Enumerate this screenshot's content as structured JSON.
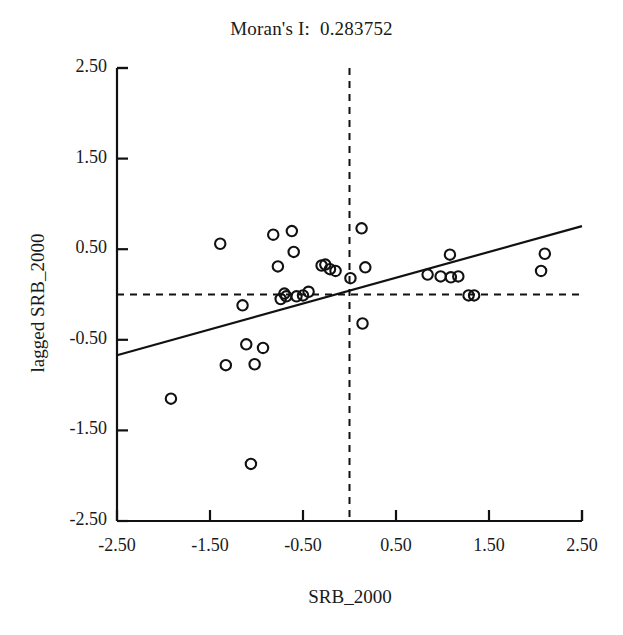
{
  "chart_data": {
    "type": "scatter",
    "title": "Moran's I:  0.283752",
    "moran_i": 0.283752,
    "xlabel": "SRB_2000",
    "ylabel": "lagged SRB_2000",
    "xlim": [
      -2.5,
      2.5
    ],
    "ylim": [
      -2.5,
      2.5
    ],
    "xticks": [
      "-2.50",
      "-1.50",
      "-0.50",
      "0.50",
      "1.50",
      "2.50"
    ],
    "xtick_values": [
      -2.5,
      -1.5,
      -0.5,
      0.5,
      1.5,
      2.5
    ],
    "yticks": [
      "2.50",
      "1.50",
      "0.50",
      "-0.50",
      "-1.50",
      "-2.50"
    ],
    "ytick_values": [
      2.5,
      1.5,
      0.5,
      -0.5,
      -1.5,
      -2.5
    ],
    "grid": false,
    "legend": null,
    "marker": "open-circle",
    "marker_color": "#111111",
    "marker_fill": "none",
    "line_color": "#111111",
    "reference_lines": {
      "vertical_x": 0,
      "horizontal_y": 0,
      "style": "dashed"
    },
    "regression_line": {
      "slope": 0.285,
      "intercept": 0.0425,
      "x_start": -2.5,
      "y_start": -0.67,
      "x_end": 2.5,
      "y_end": 0.755,
      "style": "solid"
    },
    "points": [
      {
        "x": -1.92,
        "y": -1.15
      },
      {
        "x": -1.39,
        "y": 0.56
      },
      {
        "x": -1.33,
        "y": -0.78
      },
      {
        "x": -1.15,
        "y": -0.12
      },
      {
        "x": -1.11,
        "y": -0.55
      },
      {
        "x": -1.06,
        "y": -1.87
      },
      {
        "x": -1.02,
        "y": -0.77
      },
      {
        "x": -0.93,
        "y": -0.59
      },
      {
        "x": -0.82,
        "y": 0.66
      },
      {
        "x": -0.77,
        "y": 0.31
      },
      {
        "x": -0.74,
        "y": -0.05
      },
      {
        "x": -0.7,
        "y": 0.01
      },
      {
        "x": -0.68,
        "y": -0.02
      },
      {
        "x": -0.62,
        "y": 0.7
      },
      {
        "x": -0.6,
        "y": 0.47
      },
      {
        "x": -0.57,
        "y": -0.02
      },
      {
        "x": -0.5,
        "y": -0.01
      },
      {
        "x": -0.44,
        "y": 0.03
      },
      {
        "x": -0.3,
        "y": 0.32
      },
      {
        "x": -0.26,
        "y": 0.33
      },
      {
        "x": -0.21,
        "y": 0.28
      },
      {
        "x": -0.15,
        "y": 0.26
      },
      {
        "x": 0.01,
        "y": 0.18
      },
      {
        "x": 0.13,
        "y": 0.73
      },
      {
        "x": 0.17,
        "y": 0.3
      },
      {
        "x": 0.14,
        "y": -0.32
      },
      {
        "x": 0.84,
        "y": 0.22
      },
      {
        "x": 0.98,
        "y": 0.2
      },
      {
        "x": 1.09,
        "y": 0.19
      },
      {
        "x": 1.08,
        "y": 0.44
      },
      {
        "x": 1.17,
        "y": 0.2
      },
      {
        "x": 1.28,
        "y": -0.01
      },
      {
        "x": 1.34,
        "y": -0.01
      },
      {
        "x": 2.06,
        "y": 0.26
      },
      {
        "x": 2.1,
        "y": 0.45
      }
    ]
  },
  "axes": {
    "frame": {
      "left_px": 117,
      "top_px": 68,
      "right_px": 582,
      "bottom_px": 521
    },
    "tick_mark_color": "#111111"
  }
}
